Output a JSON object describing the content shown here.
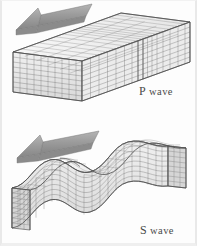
{
  "figure": {
    "background_color": "#fdfdfd",
    "width": 197,
    "height": 246
  },
  "panels": [
    {
      "id": "p-wave",
      "label_lead": "P",
      "label_rest": " wave",
      "full_label": "P wave",
      "wave_type": "compressional",
      "block": {
        "shape": "straight-rectangular-prism",
        "mesh_rows": 8,
        "mesh_cols": 22,
        "compression_band_index": 11,
        "face_colors": {
          "front": "#e8e8e8",
          "top": "#f4f4f4",
          "end": "#dcdcdc"
        },
        "grid_line_color": "#6f6f6f"
      },
      "arrow": {
        "direction": "left",
        "fill": "#9a9a9a",
        "edge": "#6a6a6a",
        "label": "propagation-direction"
      }
    },
    {
      "id": "s-wave",
      "label_lead": "S",
      "label_rest": " wave",
      "full_label": "S wave",
      "wave_type": "shear",
      "block": {
        "shape": "sinusoidal-deformed-prism",
        "mesh_rows": 8,
        "mesh_cols": 22,
        "wave_amplitude": 18,
        "wave_cycles": 1.0,
        "face_colors": {
          "front": "#e8e8e8",
          "top": "#f4f4f4",
          "end": "#dcdcdc"
        },
        "grid_line_color": "#6f6f6f"
      },
      "arrow": {
        "direction": "left",
        "fill": "#9a9a9a",
        "edge": "#6a6a6a",
        "label": "propagation-direction"
      }
    }
  ],
  "colors": {
    "background": "#fdfdfd",
    "arrow_fill": "#9a9a9a",
    "arrow_edge": "#6a6a6a",
    "mesh_line": "#6f6f6f",
    "label_text": "#4a4a4a",
    "border": "#e9e9e9"
  }
}
